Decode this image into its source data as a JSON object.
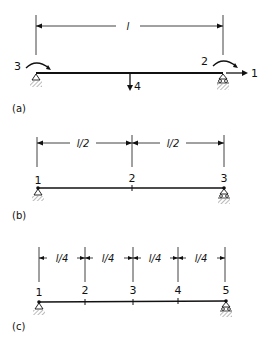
{
  "figure_a": {
    "caption": "(a)",
    "span_label": "l",
    "dof_labels": {
      "axial_right": "1",
      "rotation_right": "2",
      "rotation_left": "3",
      "vertical_mid": "4"
    }
  },
  "figure_b": {
    "caption": "(b)",
    "segment_labels": [
      "l/2",
      "l/2"
    ],
    "node_labels": [
      "1",
      "2",
      "3"
    ]
  },
  "figure_c": {
    "caption": "(c)",
    "segment_labels": [
      "l/4",
      "l/4",
      "l/4",
      "l/4"
    ],
    "node_labels": [
      "1",
      "2",
      "3",
      "4",
      "5"
    ]
  },
  "colors": {
    "ink": "#111111",
    "background": "#ffffff"
  }
}
